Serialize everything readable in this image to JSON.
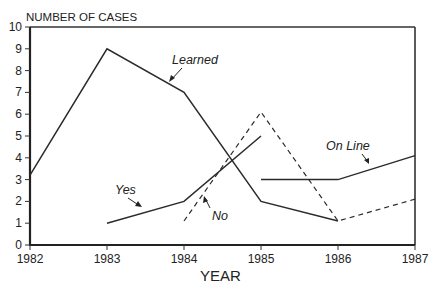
{
  "chart_data": {
    "type": "line",
    "title": "",
    "xlabel": "YEAR",
    "ylabel": "NUMBER OF CASES",
    "x": [
      1982,
      1983,
      1984,
      1985,
      1986,
      1987
    ],
    "xlim": [
      1982,
      1987
    ],
    "ylim": [
      0,
      10
    ],
    "yticks": [
      0,
      1,
      2,
      3,
      4,
      5,
      6,
      7,
      8,
      9,
      10
    ],
    "xticks": [
      1982,
      1983,
      1984,
      1985,
      1986,
      1987
    ],
    "grid": false,
    "legend": "inline labels with arrows",
    "series": [
      {
        "name": "Learned",
        "style": "solid",
        "points": [
          [
            1982,
            3.2
          ],
          [
            1983,
            9
          ],
          [
            1984,
            7
          ],
          [
            1985,
            2
          ],
          [
            1986,
            1.1
          ]
        ]
      },
      {
        "name": "Yes",
        "style": "solid",
        "points": [
          [
            1983,
            1
          ],
          [
            1984,
            2
          ],
          [
            1985,
            5
          ]
        ]
      },
      {
        "name": "No",
        "style": "dashed",
        "points": [
          [
            1984,
            1.1
          ],
          [
            1985,
            6.1
          ],
          [
            1986,
            1.1
          ],
          [
            1987,
            2.1
          ]
        ]
      },
      {
        "name": "On Line",
        "style": "solid",
        "points": [
          [
            1985,
            3
          ],
          [
            1986,
            3
          ],
          [
            1987,
            4.1
          ]
        ]
      }
    ]
  },
  "labels": {
    "ylabel": "NUMBER OF CASES",
    "xlabel": "YEAR",
    "learned": "Learned",
    "yes": "Yes",
    "no": "No",
    "online": "On Line"
  }
}
